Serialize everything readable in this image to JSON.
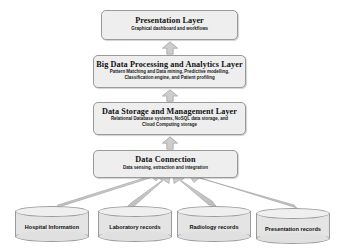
{
  "diagram": {
    "colors": {
      "box_fill": "#eeeeee",
      "box_border": "#9a9a9a",
      "arrow_fill": "#c9c9c9",
      "arrow_border": "#a6a6a6",
      "cylinder_fill": "#e4e4e4",
      "background": "#ffffff",
      "text": "#111111"
    },
    "layers": [
      {
        "id": "presentation",
        "title": "Presentation Layer",
        "subtitle": "Graphical dashboard and workflows"
      },
      {
        "id": "bigdata",
        "title": "Big Data Processing and Analytics Layer",
        "subtitle": "Pattern Matching and Data mining, Predictive modelling, Classification engine, and Patient profiling"
      },
      {
        "id": "storage",
        "title": "Data Storage and Management Layer",
        "subtitle": "Relational Database systems, NoSQL data storage, and Cloud Computing storage"
      },
      {
        "id": "connection",
        "title": "Data Connection",
        "subtitle": "Data sensing, extraction and integration"
      }
    ],
    "flow_arrows": [
      {
        "id": "arrow-connection-to-storage",
        "direction": "up",
        "from": "connection",
        "to": "storage"
      },
      {
        "id": "arrow-storage-to-bigdata",
        "direction": "up",
        "from": "storage",
        "to": "bigdata"
      },
      {
        "id": "arrow-bigdata-to-presentation",
        "direction": "up",
        "from": "bigdata",
        "to": "presentation"
      }
    ],
    "sources": [
      {
        "id": "hospital-information",
        "label": "Hospital Information"
      },
      {
        "id": "laboratory-records",
        "label": "Laboratory records"
      },
      {
        "id": "radiology-records",
        "label": "Radiology records"
      },
      {
        "id": "presentation-records",
        "label": "Presentation records"
      }
    ],
    "source_arrows": [
      {
        "id": "source-arrow-hospital-information",
        "from": "hospital-information",
        "to": "connection",
        "direction": "up-right"
      },
      {
        "id": "source-arrow-laboratory-records",
        "from": "laboratory-records",
        "to": "connection",
        "direction": "up-right"
      },
      {
        "id": "source-arrow-radiology-records",
        "from": "radiology-records",
        "to": "connection",
        "direction": "up-left"
      },
      {
        "id": "source-arrow-presentation-records",
        "from": "presentation-records",
        "to": "connection",
        "direction": "up-left"
      }
    ]
  }
}
